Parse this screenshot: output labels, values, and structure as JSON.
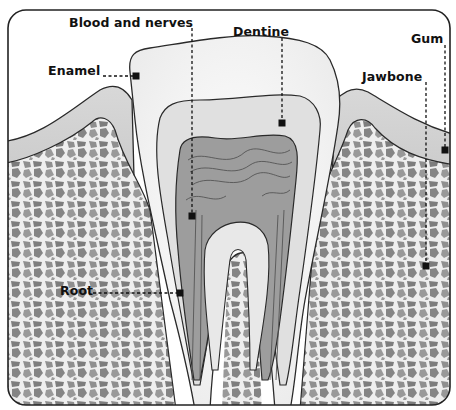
{
  "diagram": {
    "type": "anatomical-cross-section",
    "colors": {
      "background": "#ffffff",
      "frame": "#222222",
      "enamel": "#f4f4f4",
      "dentine": "#e2e2e2",
      "pulp": "#9a9a9a",
      "gum": "#bdbdbd",
      "bone_base": "#8a8a8a",
      "bone_mesh": "#eeeeee",
      "outline": "#2a2a2a",
      "leader": "#111111"
    },
    "labels": [
      {
        "id": "blood-and-nerves",
        "text": "Blood and nerves",
        "x": 69,
        "y": 20,
        "point": [
          192,
          216
        ]
      },
      {
        "id": "dentine",
        "text": "Dentine",
        "x": 233,
        "y": 28,
        "point": [
          282,
          123
        ]
      },
      {
        "id": "gum",
        "text": "Gum",
        "x": 411,
        "y": 35,
        "point": [
          445,
          150
        ]
      },
      {
        "id": "enamel",
        "text": "Enamel",
        "x": 48,
        "y": 65,
        "point": [
          136,
          76
        ]
      },
      {
        "id": "jawbone",
        "text": "Jawbone",
        "x": 362,
        "y": 70,
        "point": [
          426,
          266
        ]
      },
      {
        "id": "root",
        "text": "Root",
        "x": 60,
        "y": 284,
        "point": [
          180,
          293
        ]
      }
    ]
  }
}
